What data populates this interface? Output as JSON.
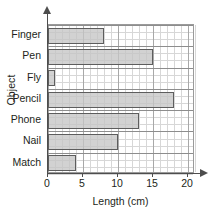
{
  "chart_data": {
    "type": "bar",
    "orientation": "horizontal",
    "title": "",
    "xlabel": "Length (cm)",
    "ylabel": "Object",
    "categories": [
      "Finger",
      "Pen",
      "Fly",
      "Pencil",
      "Phone",
      "Nail",
      "Match"
    ],
    "values": [
      8,
      15,
      1,
      18,
      13,
      10,
      4
    ],
    "series": [
      {
        "name": "Length",
        "values": [
          8,
          15,
          1,
          18,
          13,
          10,
          4
        ]
      }
    ],
    "xlim": [
      0,
      21
    ],
    "xticks": [
      0,
      5,
      10,
      15,
      20
    ],
    "xticklabels": [
      "0",
      "5",
      "10",
      "15",
      "20"
    ],
    "minor_tick_step": 1,
    "grid": true,
    "legend": false,
    "bar_fill_color": "#c5c5c5",
    "bar_edge_color": "#5d5d5d",
    "axis_color": "#4d4d4d",
    "grid_color": "#d7d7d7",
    "major_grid_color": "#a8a8a8",
    "text_color": "#231f20"
  }
}
